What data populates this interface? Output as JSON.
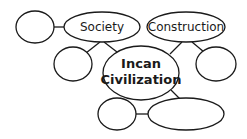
{
  "diagram": {
    "type": "concept-web",
    "center": {
      "line1": "Incan",
      "line2": "Civilization"
    },
    "nodes": {
      "society": "Society",
      "construction": "Construction",
      "left_blank": "",
      "left_mid_blank": "",
      "right_blank": "",
      "bottom_small_blank": "",
      "bottom_large_blank": ""
    },
    "edges": [
      [
        "left_blank",
        "society"
      ],
      [
        "society",
        "left_mid_blank"
      ],
      [
        "society",
        "center"
      ],
      [
        "construction",
        "center"
      ],
      [
        "construction",
        "right_blank"
      ],
      [
        "center",
        "bottom_large_blank"
      ],
      [
        "bottom_small_blank",
        "bottom_large_blank"
      ]
    ]
  }
}
